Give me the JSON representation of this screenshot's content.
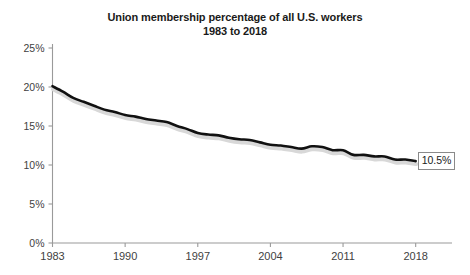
{
  "chart_data": {
    "type": "line",
    "title": "Union membership percentage of all U.S. workers 1983 to 2018",
    "title_lines": [
      "Union membership percentage of all U.S. workers",
      "1983 to 2018"
    ],
    "xlabel": "",
    "ylabel": "",
    "x": [
      1983,
      1984,
      1985,
      1986,
      1987,
      1988,
      1989,
      1990,
      1991,
      1992,
      1993,
      1994,
      1995,
      1996,
      1997,
      1998,
      1999,
      2000,
      2001,
      2002,
      2003,
      2004,
      2005,
      2006,
      2007,
      2008,
      2009,
      2010,
      2011,
      2012,
      2013,
      2014,
      2015,
      2016,
      2017,
      2018
    ],
    "values": [
      20.1,
      19.4,
      18.6,
      18.1,
      17.6,
      17.1,
      16.8,
      16.4,
      16.2,
      15.9,
      15.7,
      15.5,
      15.0,
      14.6,
      14.1,
      13.9,
      13.8,
      13.5,
      13.3,
      13.2,
      12.9,
      12.6,
      12.5,
      12.3,
      12.1,
      12.4,
      12.3,
      11.9,
      11.9,
      11.3,
      11.3,
      11.1,
      11.1,
      10.7,
      10.7,
      10.5
    ],
    "series": [
      {
        "name": "Union membership percentage",
        "color": "#111111",
        "values": [
          20.1,
          19.4,
          18.6,
          18.1,
          17.6,
          17.1,
          16.8,
          16.4,
          16.2,
          15.9,
          15.7,
          15.5,
          15.0,
          14.6,
          14.1,
          13.9,
          13.8,
          13.5,
          13.3,
          13.2,
          12.9,
          12.6,
          12.5,
          12.3,
          12.1,
          12.4,
          12.3,
          11.9,
          11.9,
          11.3,
          11.3,
          11.1,
          11.1,
          10.7,
          10.7,
          10.5
        ]
      }
    ],
    "xlim": [
      1983,
      2021.5
    ],
    "ylim": [
      0,
      25
    ],
    "y_ticks": [
      0,
      5,
      10,
      15,
      20,
      25
    ],
    "y_tick_labels": [
      "0%",
      "5%",
      "10%",
      "15%",
      "20%",
      "25%"
    ],
    "x_ticks": [
      1983,
      1990,
      1997,
      2004,
      2011,
      2018
    ],
    "x_tick_labels": [
      "1983",
      "1990",
      "1997",
      "2004",
      "2011",
      "2018"
    ],
    "grid": false,
    "legend": false,
    "legend_position": "none",
    "annotations": [
      {
        "name": "end-value-label",
        "text": "10.5%",
        "x": 2018,
        "y": 10.5
      }
    ],
    "colors": {
      "line": "#111111",
      "line_shadow": "#d8d8d8",
      "axis": "#9a9a9a",
      "tick_text": "#3f3f3f",
      "title_text": "#1a1a1a",
      "callout_border": "#8a8a8a",
      "background": "#ffffff"
    }
  }
}
